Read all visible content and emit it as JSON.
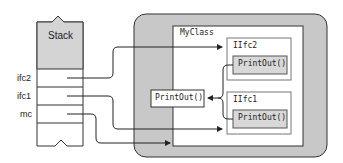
{
  "stack": {
    "title": "Stack",
    "slots": [
      {
        "label": "ifc2"
      },
      {
        "label": "ifc1"
      },
      {
        "label": "mc"
      }
    ]
  },
  "heap": {
    "class_name": "MyClass",
    "method": "PrintOut()",
    "interfaces": [
      {
        "name": "IIfc2",
        "method": "PrintOut()"
      },
      {
        "name": "IIfc1",
        "method": "PrintOut()"
      }
    ]
  },
  "colors": {
    "stack_fill": "#d4d4d4",
    "heap_fill": "#c8c8c8",
    "method_fill": "#d8d8d8",
    "line": "#222222"
  }
}
